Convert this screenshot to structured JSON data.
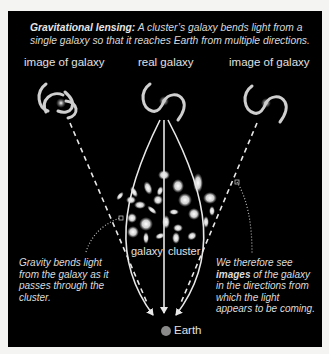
{
  "caption": {
    "title": "Gravitational lensing:",
    "text": " A cluster’s galaxy bends light from a single galaxy so that it reaches Earth from multiple directions."
  },
  "labels": {
    "left_image": "image of galaxy",
    "real": "real galaxy",
    "right_image": "image of galaxy",
    "cluster_left": "galaxy",
    "cluster_right": "cluster",
    "earth": "Earth"
  },
  "notes": {
    "left": "Gravity bends light from the galaxy as it passes through the cluster.",
    "right_pre": "We therefore see ",
    "right_bold": "images",
    "right_post": " of the galaxy in the directions from which the light appears to be coming."
  },
  "colors": {
    "panel": "#000000",
    "page": "#f4f4f2",
    "line": "#e8e8e8",
    "earth": "#8a8a8a"
  }
}
